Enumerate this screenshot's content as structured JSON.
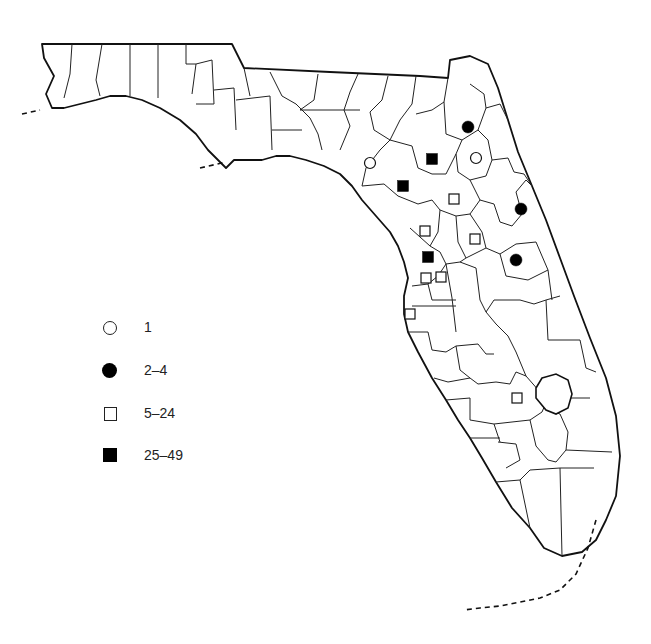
{
  "map": {
    "subject": "Florida county distribution map",
    "legend": [
      {
        "symbol": "open-circle",
        "label": "1"
      },
      {
        "symbol": "filled-circle",
        "label": "2–4"
      },
      {
        "symbol": "open-square",
        "label": "5–24"
      },
      {
        "symbol": "filled-square",
        "label": "25–49"
      }
    ],
    "markers": [
      {
        "symbol": "open-circle",
        "x": 370,
        "y": 163
      },
      {
        "symbol": "open-circle",
        "x": 476,
        "y": 158
      },
      {
        "symbol": "filled-circle",
        "x": 468,
        "y": 127
      },
      {
        "symbol": "filled-circle",
        "x": 521,
        "y": 209
      },
      {
        "symbol": "filled-circle",
        "x": 516,
        "y": 260
      },
      {
        "symbol": "filled-square",
        "x": 432,
        "y": 159
      },
      {
        "symbol": "filled-square",
        "x": 403,
        "y": 186
      },
      {
        "symbol": "filled-square",
        "x": 428,
        "y": 257
      },
      {
        "symbol": "open-square",
        "x": 454,
        "y": 199
      },
      {
        "symbol": "open-square",
        "x": 425,
        "y": 231
      },
      {
        "symbol": "open-square",
        "x": 475,
        "y": 239
      },
      {
        "symbol": "open-square",
        "x": 426,
        "y": 278
      },
      {
        "symbol": "open-square",
        "x": 441,
        "y": 277
      },
      {
        "symbol": "open-square",
        "x": 410,
        "y": 314
      },
      {
        "symbol": "open-square",
        "x": 517,
        "y": 398
      }
    ],
    "colors": {
      "ink": "#111111",
      "background": "#ffffff"
    }
  }
}
